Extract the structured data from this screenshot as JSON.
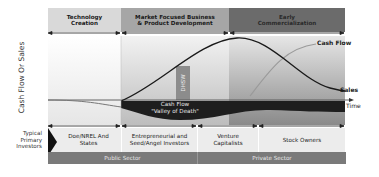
{
  "diagram": {
    "y_axis_label": "Cash Flow Or Sales",
    "x_axis_label": "Time",
    "phases": [
      {
        "label": "Technology Creation",
        "color": "#d9d9d9"
      },
      {
        "label": "Market Focused Business & Product Development",
        "color": "#a6a6a6"
      },
      {
        "label": "Early Commercialization",
        "color": "#6b6b6b"
      }
    ],
    "curves": {
      "cash_flow_label": "Cash Flow",
      "sales_label": "Sales"
    },
    "valley": {
      "line1": "Cash Flow",
      "line2": "\"Valley of Death\""
    },
    "vertical_bar_label": "DHSW",
    "investors_title": "Typical Primary Investors",
    "investors": [
      {
        "label": "Doe/NREL And States"
      },
      {
        "label": "Entrepreneurial and Seed/Angel Investors"
      },
      {
        "label": "Venture Capitalists"
      },
      {
        "label": "Stock Owners"
      }
    ],
    "sectors": [
      {
        "label": "Public Sector"
      },
      {
        "label": "Private Sector"
      }
    ],
    "colors": {
      "band_light": "#d9d9d9",
      "band_mid": "#a6a6a6",
      "band_dark": "#6b6b6b",
      "valley_fill": "#1e1e1e",
      "sector_band": "#7a7a7a",
      "investor_row": "#ececec"
    }
  }
}
